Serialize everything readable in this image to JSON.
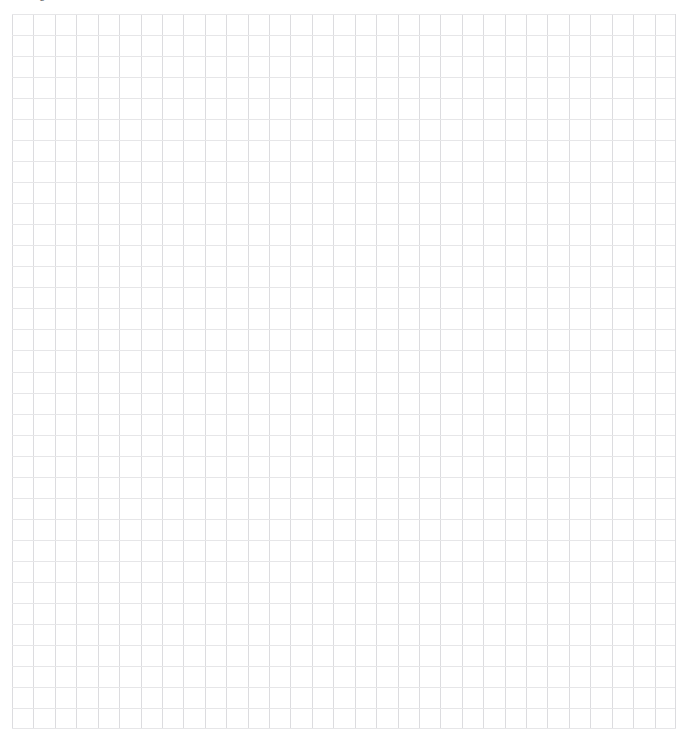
{
  "page": {
    "background_color": "#ffffff",
    "width": 687,
    "height": 736
  },
  "header": {
    "clipped_text": "Figure 1.",
    "clipped_secondary": "v",
    "note": "text is clipped by the top edge of the viewport; only the lower pixel rows of the glyphs are visible"
  },
  "grid": {
    "label": "graph paper grid",
    "columns": 31,
    "rows": 34,
    "cell_width_px": 21.42,
    "cell_height_px": 21.03,
    "origin_x_px": 12,
    "origin_y_px": 14,
    "width_px": 664,
    "height_px": 715,
    "vertical_line_color": "#dcdcdf",
    "horizontal_line_color": "#e6e6e8",
    "line_width_px": 1,
    "grid_visible": true
  }
}
